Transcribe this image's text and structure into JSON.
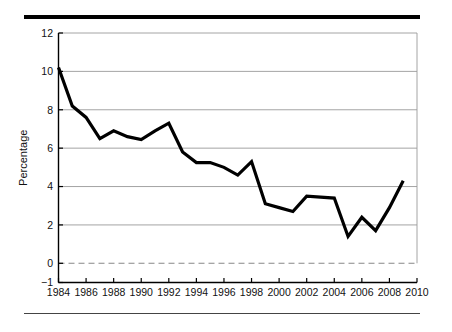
{
  "figure": {
    "top_rule": "top-rule",
    "bottom_rule": "bottom-rule"
  },
  "chart_data": {
    "type": "line",
    "title": "",
    "subtitle": "",
    "xlabel": "",
    "ylabel": "Percentage",
    "x": [
      1984,
      1985,
      1986,
      1987,
      1988,
      1989,
      1990,
      1991,
      1992,
      1993,
      1994,
      1995,
      1996,
      1997,
      1998,
      1999,
      2000,
      2001,
      2002,
      2003,
      2004,
      2005,
      2006,
      2007,
      2008,
      2009
    ],
    "values": [
      10.2,
      8.2,
      7.6,
      6.5,
      6.9,
      6.6,
      6.45,
      6.9,
      7.3,
      5.8,
      5.25,
      5.25,
      5.0,
      4.6,
      5.3,
      3.1,
      2.9,
      2.7,
      3.5,
      3.45,
      3.4,
      1.4,
      2.4,
      1.7,
      2.9,
      4.3
    ],
    "series": [
      {
        "name": "Percentage",
        "values": [
          10.2,
          8.2,
          7.6,
          6.5,
          6.9,
          6.6,
          6.45,
          6.9,
          7.3,
          5.8,
          5.25,
          5.25,
          5.0,
          4.6,
          5.3,
          3.1,
          2.9,
          2.7,
          3.5,
          3.45,
          3.4,
          1.4,
          2.4,
          1.7,
          2.9,
          4.3
        ],
        "color": "#000000",
        "line_width": 3.2
      }
    ],
    "xlim": [
      1984,
      2010
    ],
    "ylim": [
      -1,
      12
    ],
    "ytick_labels": [
      "12",
      "10",
      "8",
      "6",
      "4",
      "2",
      "0",
      "-1"
    ],
    "ytick_values": [
      12,
      10,
      8,
      6,
      4,
      2,
      0,
      -1
    ],
    "xtick_labels": [
      "1984",
      "1986",
      "1988",
      "1990",
      "1992",
      "1994",
      "1996",
      "1998",
      "2000",
      "2002",
      "2004",
      "2006",
      "2008",
      "2010"
    ],
    "xtick_values": [
      1984,
      1986,
      1988,
      1990,
      1992,
      1994,
      1996,
      1998,
      2000,
      2002,
      2004,
      2006,
      2008,
      2010
    ],
    "gridlines": {
      "horizontal": [
        12,
        10,
        8,
        6,
        4,
        2
      ],
      "color": "#9a9a9a",
      "visible": true
    },
    "zero_line": {
      "value": 0,
      "style": "dashed",
      "color": "#888888"
    },
    "legend": {
      "visible": false,
      "position": "none"
    },
    "annotations": []
  }
}
